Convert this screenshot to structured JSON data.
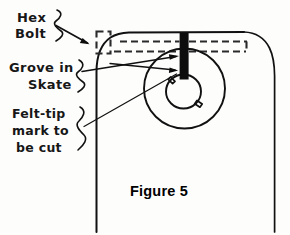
{
  "figure": {
    "caption": "Figure 5",
    "background_color": "#fdfdfc",
    "ink_color": "#111111",
    "media": "scanned hand-annotated line drawing"
  },
  "annotations": [
    {
      "id": "hex-bolt",
      "line1": "Hex",
      "line2": "Bolt",
      "brace": "}",
      "pointer": "arrow pointing right to dashed bolt rectangle"
    },
    {
      "id": "groove-in-skate",
      "line1": "Grove in",
      "line2": "Skate",
      "brace": "}",
      "pointer": "arrow pointing right to black bar at groove"
    },
    {
      "id": "felt-tip-mark",
      "line1": "Felt-tip",
      "line2": "mark to",
      "line3": "be cut",
      "brace": "}",
      "pointer": "long thin leader line to wheel hub area"
    }
  ],
  "drawing_parts": {
    "body_outline": "skate body with curved top-left and top-right corners and straight vertical sides",
    "hex_bolt_rect": "small dashed rectangle at upper left of the body",
    "groove_dashed_lines": "two horizontal dashed lines forming the groove channel",
    "bolt_bar": "thick solid black vertical bar through the groove into the hub",
    "outer_circle": "large wheel outer circle",
    "inner_circle": "wheel hub inner circle",
    "hub_nubs": "two small tab shapes on the hub at upper-left and right"
  }
}
